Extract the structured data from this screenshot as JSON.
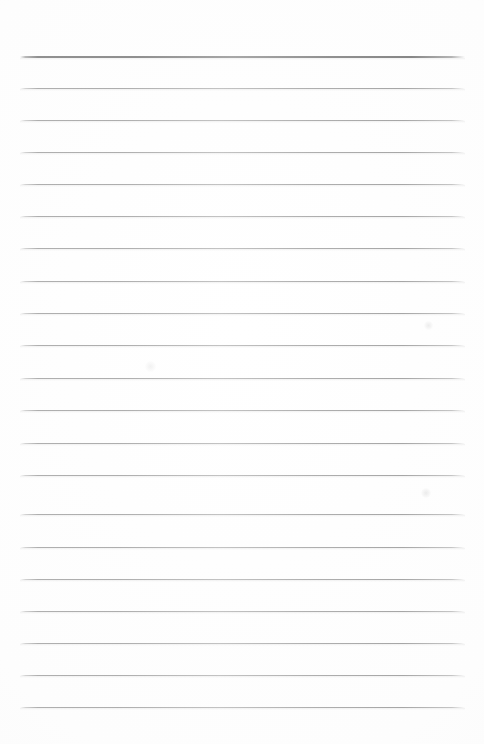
{
  "document": {
    "type": "scanned-lined-paper",
    "title": "Blank lined notepad page",
    "has_text_content": false,
    "page_width": 484,
    "page_height": 744,
    "background_color": "#fdfdfd",
    "margins": {
      "top": 55,
      "bottom": 37,
      "left": 20,
      "right": 19
    }
  },
  "ruling": {
    "style": "wide-ruled",
    "line_color": "#b0b0b0",
    "header_rule_color": "#8f8f8f",
    "line_pitch": 32,
    "line_left": 20,
    "line_right": 465,
    "line_width": 445,
    "header_rule_thickness": 2,
    "body_rule_thickness": 1,
    "total_rules": 21,
    "rules": [
      {
        "index": 0,
        "y": 56,
        "kind": "header"
      },
      {
        "index": 1,
        "y": 88,
        "kind": "body"
      },
      {
        "index": 2,
        "y": 120,
        "kind": "body"
      },
      {
        "index": 3,
        "y": 152,
        "kind": "body"
      },
      {
        "index": 4,
        "y": 184,
        "kind": "body"
      },
      {
        "index": 5,
        "y": 216,
        "kind": "body"
      },
      {
        "index": 6,
        "y": 248,
        "kind": "body"
      },
      {
        "index": 7,
        "y": 281,
        "kind": "body"
      },
      {
        "index": 8,
        "y": 313,
        "kind": "body"
      },
      {
        "index": 9,
        "y": 345,
        "kind": "body"
      },
      {
        "index": 10,
        "y": 378,
        "kind": "body"
      },
      {
        "index": 11,
        "y": 410,
        "kind": "body"
      },
      {
        "index": 12,
        "y": 443,
        "kind": "body"
      },
      {
        "index": 13,
        "y": 475,
        "kind": "body"
      },
      {
        "index": 14,
        "y": 514,
        "kind": "body"
      },
      {
        "index": 15,
        "y": 547,
        "kind": "body"
      },
      {
        "index": 16,
        "y": 579,
        "kind": "body"
      },
      {
        "index": 17,
        "y": 611,
        "kind": "body"
      },
      {
        "index": 18,
        "y": 643,
        "kind": "body"
      },
      {
        "index": 19,
        "y": 675,
        "kind": "body"
      },
      {
        "index": 20,
        "y": 707,
        "kind": "body"
      }
    ]
  },
  "artifacts": {
    "smudges": [
      {
        "name": "smudge-upper-right",
        "x": 428,
        "y": 325,
        "size": 9,
        "opacity": 0.55
      },
      {
        "name": "smudge-mid-left",
        "x": 150,
        "y": 366,
        "size": 11,
        "opacity": 0.4
      },
      {
        "name": "smudge-lower-right",
        "x": 426,
        "y": 493,
        "size": 10,
        "opacity": 0.6
      }
    ]
  }
}
